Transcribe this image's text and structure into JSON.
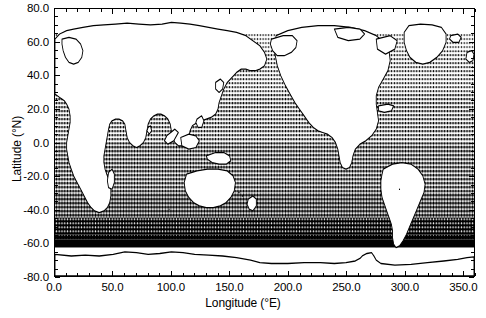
{
  "figure": {
    "kind": "world-map-plot",
    "background_color": "#ffffff",
    "foreground_color": "#000000"
  },
  "axes": {
    "x_title": "Longitude (°E)",
    "y_title": "Latitude (°N)",
    "x_ticks": [
      "0.0",
      "50.0",
      "100.0",
      "150.0",
      "200.0",
      "250.0",
      "300.0",
      "350.0"
    ],
    "y_ticks": [
      "80.0",
      "60.0",
      "40.0",
      "20.0",
      "0.0",
      "-20.0",
      "-40.0",
      "-60.0",
      "-80.0"
    ]
  },
  "chart_data": {
    "type": "heatmap",
    "title": "",
    "xlabel": "Longitude (°E)",
    "ylabel": "Latitude (°N)",
    "xlim": [
      0,
      360
    ],
    "ylim": [
      -80,
      80
    ],
    "xtick_values": [
      0,
      50,
      100,
      150,
      200,
      250,
      300,
      350
    ],
    "xtick_labels": [
      "0.0",
      "50.0",
      "100.0",
      "150.0",
      "200.0",
      "250.0",
      "300.0",
      "350.0"
    ],
    "ytick_values": [
      80,
      60,
      40,
      20,
      0,
      -20,
      -40,
      -60,
      -80
    ],
    "ytick_labels": [
      "80.0",
      "60.0",
      "40.0",
      "20.0",
      "0.0",
      "-20.0",
      "-40.0",
      "-60.0",
      "-80.0"
    ],
    "x_minor_tick_interval": 10,
    "y_minor_tick_interval": 5,
    "grid": false,
    "legend": null,
    "projection": "cylindrical equidistant (Plate Carree)",
    "land_fill": "#ffffff",
    "ocean_fill": "stipple-dot-pattern",
    "shading_bands": [
      {
        "lat_from": 80,
        "lat_to": 65,
        "density": 0.0,
        "note": "blank / no coverage"
      },
      {
        "lat_from": 65,
        "lat_to": 55,
        "density": 0.3,
        "note": "light stipple (high-latitude N)"
      },
      {
        "lat_from": 55,
        "lat_to": 30,
        "density": 0.38,
        "note": "medium stipple"
      },
      {
        "lat_from": 30,
        "lat_to": 0,
        "density": 0.45,
        "note": "medium stipple"
      },
      {
        "lat_from": 0,
        "lat_to": -30,
        "density": 0.5,
        "note": "medium-dense stipple"
      },
      {
        "lat_from": -30,
        "lat_to": -45,
        "density": 0.6,
        "note": "dense stipple"
      },
      {
        "lat_from": -45,
        "lat_to": -55,
        "density": 0.78,
        "note": "very dense stipple"
      },
      {
        "lat_from": -55,
        "lat_to": -63,
        "density": 1.0,
        "note": "saturated / solid black"
      },
      {
        "lat_from": -63,
        "lat_to": -80,
        "density": 0.0,
        "note": "blank (Antarctica, outline only)"
      }
    ]
  }
}
